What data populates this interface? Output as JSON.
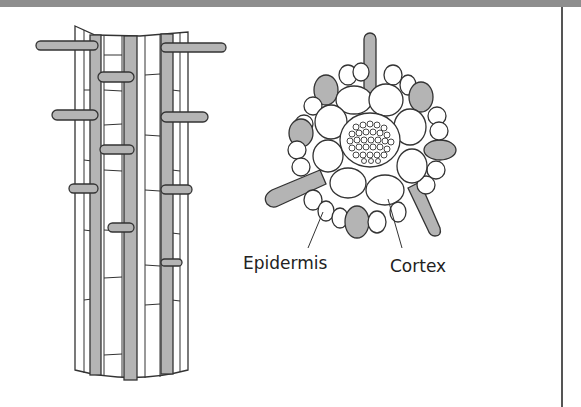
{
  "figure": {
    "labels": {
      "epidermis": "Epidermis",
      "cortex": "Cortex"
    },
    "colors": {
      "hair_fill": "#b4b4b4",
      "outline": "#333333",
      "top_band": "#8e8e8e",
      "background": "#ffffff"
    }
  }
}
